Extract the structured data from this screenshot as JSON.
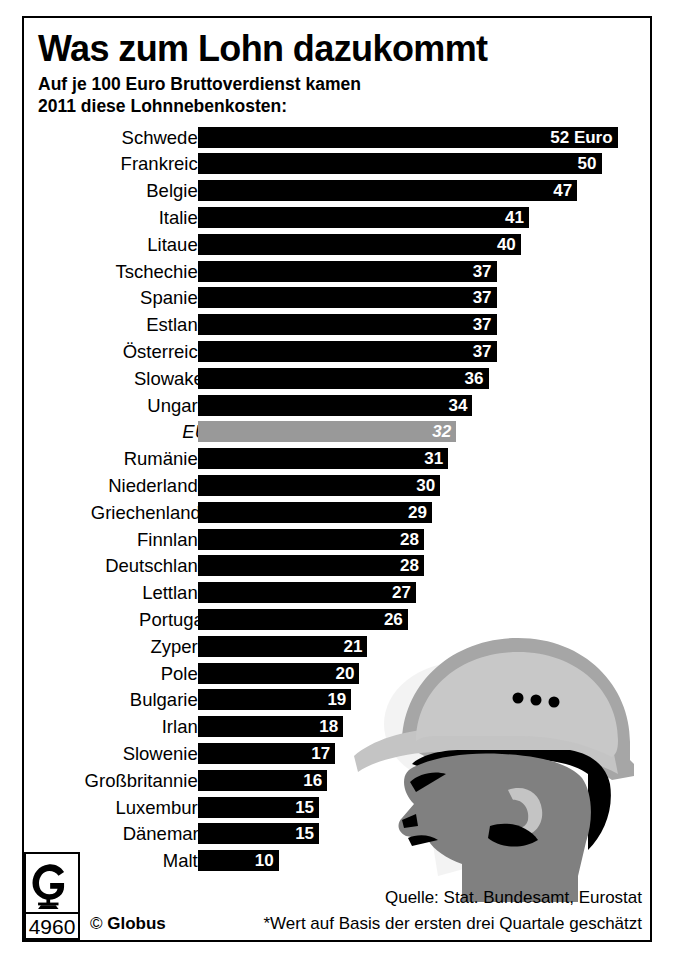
{
  "title": "Was zum Lohn dazukommt",
  "subtitle_line1": "Auf je 100 Euro Bruttoverdienst kamen",
  "subtitle_line2": "2011 diese Lohnnebenkosten:",
  "footer": {
    "source": "Quelle: Stat. Bundesamt, Eurostat",
    "note": "*Wert auf Basis der ersten drei Quartale geschätzt",
    "copyright_symbol": "©",
    "copyright_name": "Globus",
    "logo_number": "4960",
    "logo_letter": "G"
  },
  "colors": {
    "bar": "#000000",
    "bar_eu": "#999999",
    "value_text": "#ffffff",
    "background": "#ffffff",
    "frame": "#000000",
    "helmet_light": "#c0c0c0",
    "helmet_mid": "#a6a6a6",
    "face": "#808080",
    "hair": "#000000"
  },
  "chart_data": {
    "type": "bar",
    "orientation": "horizontal",
    "title": "Was zum Lohn dazukommt",
    "subtitle": "Auf je 100 Euro Bruttoverdienst kamen 2011 diese Lohnnebenkosten:",
    "xlabel": "",
    "ylabel": "",
    "unit": "Euro",
    "xlim": [
      0,
      52
    ],
    "grid": false,
    "legend": false,
    "categories": [
      "Schweden",
      "Frankreich",
      "Belgien",
      "Italien",
      "Litauen",
      "Tschechien",
      "Spanien",
      "Estland",
      "Österreich",
      "Slowakei",
      "Ungarn",
      "EU",
      "Rumänien",
      "Niederlande",
      "Griechenland*",
      "Finnland",
      "Deutschland",
      "Lettland",
      "Portugal",
      "Zypern",
      "Polen",
      "Bulgarien",
      "Irland",
      "Slowenien",
      "Großbritannien",
      "Luxemburg",
      "Dänemark",
      "Malta"
    ],
    "values": [
      52,
      50,
      47,
      41,
      40,
      37,
      37,
      37,
      37,
      36,
      34,
      32,
      31,
      30,
      29,
      28,
      28,
      27,
      26,
      21,
      20,
      19,
      18,
      17,
      16,
      15,
      15,
      10
    ],
    "value_labels": [
      "52 Euro",
      "50",
      "47",
      "41",
      "40",
      "37",
      "37",
      "37",
      "37",
      "36",
      "34",
      "32",
      "31",
      "30",
      "29",
      "28",
      "28",
      "27",
      "26",
      "21",
      "20",
      "19",
      "18",
      "17",
      "16",
      "15",
      "15",
      "10"
    ],
    "highlight_index": 11,
    "highlight_label": "EU"
  },
  "rows": [
    {
      "label": "Schweden",
      "value": 52,
      "value_label": "52 Euro",
      "highlight": false
    },
    {
      "label": "Frankreich",
      "value": 50,
      "value_label": "50",
      "highlight": false
    },
    {
      "label": "Belgien",
      "value": 47,
      "value_label": "47",
      "highlight": false
    },
    {
      "label": "Italien",
      "value": 41,
      "value_label": "41",
      "highlight": false
    },
    {
      "label": "Litauen",
      "value": 40,
      "value_label": "40",
      "highlight": false
    },
    {
      "label": "Tschechien",
      "value": 37,
      "value_label": "37",
      "highlight": false
    },
    {
      "label": "Spanien",
      "value": 37,
      "value_label": "37",
      "highlight": false
    },
    {
      "label": "Estland",
      "value": 37,
      "value_label": "37",
      "highlight": false
    },
    {
      "label": "Österreich",
      "value": 37,
      "value_label": "37",
      "highlight": false
    },
    {
      "label": "Slowakei",
      "value": 36,
      "value_label": "36",
      "highlight": false
    },
    {
      "label": "Ungarn",
      "value": 34,
      "value_label": "34",
      "highlight": false
    },
    {
      "label": "EU",
      "value": 32,
      "value_label": "32",
      "highlight": true
    },
    {
      "label": "Rumänien",
      "value": 31,
      "value_label": "31",
      "highlight": false
    },
    {
      "label": "Niederlande",
      "value": 30,
      "value_label": "30",
      "highlight": false
    },
    {
      "label": "Griechenland*",
      "value": 29,
      "value_label": "29",
      "highlight": false
    },
    {
      "label": "Finnland",
      "value": 28,
      "value_label": "28",
      "highlight": false
    },
    {
      "label": "Deutschland",
      "value": 28,
      "value_label": "28",
      "highlight": false
    },
    {
      "label": "Lettland",
      "value": 27,
      "value_label": "27",
      "highlight": false
    },
    {
      "label": "Portugal",
      "value": 26,
      "value_label": "26",
      "highlight": false
    },
    {
      "label": "Zypern",
      "value": 21,
      "value_label": "21",
      "highlight": false
    },
    {
      "label": "Polen",
      "value": 20,
      "value_label": "20",
      "highlight": false
    },
    {
      "label": "Bulgarien",
      "value": 19,
      "value_label": "19",
      "highlight": false
    },
    {
      "label": "Irland",
      "value": 18,
      "value_label": "18",
      "highlight": false
    },
    {
      "label": "Slowenien",
      "value": 17,
      "value_label": "17",
      "highlight": false
    },
    {
      "label": "Großbritannien",
      "value": 16,
      "value_label": "16",
      "highlight": false
    },
    {
      "label": "Luxemburg",
      "value": 15,
      "value_label": "15",
      "highlight": false
    },
    {
      "label": "Dänemark",
      "value": 15,
      "value_label": "15",
      "highlight": false
    },
    {
      "label": "Malta",
      "value": 10,
      "value_label": "10",
      "highlight": false
    }
  ]
}
